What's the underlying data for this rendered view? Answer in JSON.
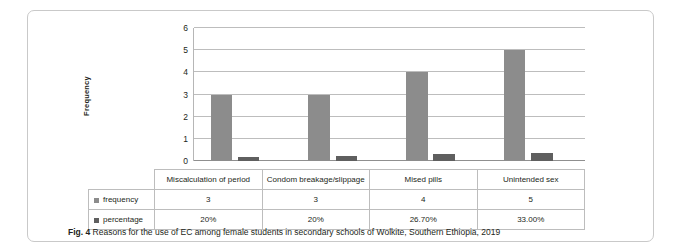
{
  "figure": {
    "caption_label": "Fig. 4",
    "caption_text": "Reasons for the use of EC among female students in secondary schools of Wolkite, Southern Ethiopia, 2019"
  },
  "chart_data": {
    "type": "bar",
    "title": "",
    "xlabel": "",
    "ylabel": "Frequency",
    "ylim": [
      0,
      6
    ],
    "yticks": [
      "0",
      "1",
      "2",
      "3",
      "4",
      "5",
      "6"
    ],
    "grid": true,
    "legend_position": "data-table",
    "categories": [
      "Miscalculation of period",
      "Condom breakage/slippage",
      "Mised pills",
      "Unintended sex"
    ],
    "series": [
      {
        "name": "frequency",
        "color": "#8c8c8c",
        "values": [
          3,
          3,
          4,
          5
        ],
        "labels": [
          "3",
          "3",
          "4",
          "5"
        ]
      },
      {
        "name": "percentage",
        "color": "#5f5f5f",
        "values": [
          0.2,
          0.22,
          0.3,
          0.38
        ],
        "labels": [
          "20%",
          "20%",
          "26.70%",
          "33.00%"
        ]
      }
    ]
  }
}
